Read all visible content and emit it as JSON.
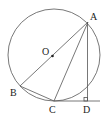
{
  "diagram": {
    "type": "geometry",
    "circle": {
      "center": [
        54,
        55
      ],
      "radius": 46
    },
    "points": {
      "A": {
        "label": "A",
        "pos": [
          88,
          22
        ],
        "label_pos": [
          90,
          20
        ]
      },
      "B": {
        "label": "B",
        "pos": [
          20,
          86
        ],
        "label_pos": [
          10,
          96
        ]
      },
      "O": {
        "label": "O",
        "pos": [
          52.5,
          56
        ],
        "label_pos": [
          42,
          54
        ]
      },
      "C": {
        "label": "C",
        "pos": [
          54,
          101
        ],
        "label_pos": [
          50,
          113
        ]
      },
      "D": {
        "label": "D",
        "pos": [
          87,
          101
        ],
        "label_pos": [
          84,
          113
        ]
      }
    },
    "segments": [
      [
        "A",
        "B"
      ],
      [
        "A",
        "C"
      ],
      [
        "A",
        "D"
      ],
      [
        "B",
        "C"
      ]
    ],
    "extended_line": {
      "from": [
        54,
        101
      ],
      "to": [
        100,
        101
      ]
    },
    "right_angle_at": "D",
    "colors": {
      "stroke": "#555555",
      "text": "#222222"
    }
  }
}
